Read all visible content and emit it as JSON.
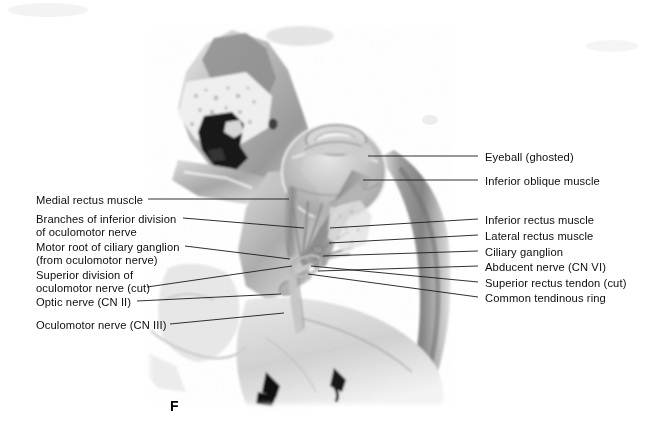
{
  "figure": {
    "letter": "F",
    "background_color": "#ffffff",
    "line_color": "#1a1a1a",
    "text_color": "#0d0d0d",
    "width": 645,
    "height": 438
  },
  "labels_left": [
    {
      "name": "medial-rectus-muscle",
      "text": "Medial rectus muscle",
      "x": 36,
      "y": 194,
      "line": {
        "x1": 148,
        "y1": 199,
        "x2": 289,
        "y2": 199
      }
    },
    {
      "name": "branches-inferior-division-oculomotor-nerve",
      "text": "Branches of inferior division\nof oculomotor nerve",
      "x": 36,
      "y": 213,
      "line": {
        "x1": 183,
        "y1": 218,
        "x2": 304,
        "y2": 228
      }
    },
    {
      "name": "motor-root-ciliary-ganglion",
      "text": "Motor root of ciliary ganglion\n(from oculomotor nerve)",
      "x": 36,
      "y": 241,
      "line": {
        "x1": 185,
        "y1": 246,
        "x2": 290,
        "y2": 259
      }
    },
    {
      "name": "superior-division-oculomotor-nerve-cut",
      "text": "Superior division of\noculomotor nerve (cut)",
      "x": 36,
      "y": 269,
      "line": {
        "x1": 147,
        "y1": 287,
        "x2": 292,
        "y2": 266
      }
    },
    {
      "name": "optic-nerve-cn-ii",
      "text": "Optic nerve (CN II)",
      "x": 36,
      "y": 296,
      "line": {
        "x1": 137,
        "y1": 301,
        "x2": 281,
        "y2": 294
      }
    },
    {
      "name": "oculomotor-nerve-cn-iii",
      "text": "Oculomotor nerve (CN III)",
      "x": 36,
      "y": 319,
      "line": {
        "x1": 170,
        "y1": 324,
        "x2": 284,
        "y2": 313
      }
    }
  ],
  "labels_right": [
    {
      "name": "eyeball-ghosted",
      "text": "Eyeball (ghosted)",
      "x": 485,
      "y": 151,
      "line": {
        "x1": 368,
        "y1": 156,
        "x2": 478,
        "y2": 156
      }
    },
    {
      "name": "inferior-oblique-muscle",
      "text": "Inferior oblique muscle",
      "x": 485,
      "y": 175,
      "line": {
        "x1": 363,
        "y1": 180,
        "x2": 478,
        "y2": 180
      }
    },
    {
      "name": "inferior-rectus-muscle",
      "text": "Inferior rectus muscle",
      "x": 485,
      "y": 214,
      "line": {
        "x1": 330,
        "y1": 228,
        "x2": 478,
        "y2": 219
      }
    },
    {
      "name": "lateral-rectus-muscle",
      "text": "Lateral rectus muscle",
      "x": 485,
      "y": 230,
      "line": {
        "x1": 329,
        "y1": 243,
        "x2": 478,
        "y2": 235
      }
    },
    {
      "name": "ciliary-ganglion",
      "text": "Ciliary ganglion",
      "x": 485,
      "y": 246,
      "line": {
        "x1": 323,
        "y1": 256,
        "x2": 478,
        "y2": 251
      }
    },
    {
      "name": "abducent-nerve-cn-vi",
      "text": "Abducent nerve (CN VI)",
      "x": 485,
      "y": 261,
      "line": {
        "x1": 318,
        "y1": 271,
        "x2": 478,
        "y2": 266
      }
    },
    {
      "name": "superior-rectus-tendon-cut",
      "text": "Superior rectus tendon (cut)",
      "x": 485,
      "y": 277,
      "line": {
        "x1": 311,
        "y1": 266,
        "x2": 478,
        "y2": 282
      }
    },
    {
      "name": "common-tendinous-ring",
      "text": "Common tendinous ring",
      "x": 485,
      "y": 292,
      "line": {
        "x1": 308,
        "y1": 274,
        "x2": 478,
        "y2": 297
      }
    }
  ]
}
